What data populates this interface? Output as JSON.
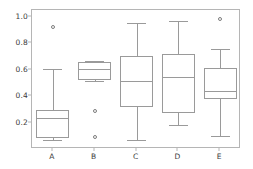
{
  "chart_data": {
    "type": "box",
    "title": "",
    "xlabel": "",
    "ylabel": "",
    "categories": [
      "A",
      "B",
      "C",
      "D",
      "E"
    ],
    "ylim": [
      0.0,
      1.05
    ],
    "yticks": [
      0.2,
      0.4,
      0.6,
      0.8,
      1.0
    ],
    "ytick_labels": [
      "0.2",
      "0.4",
      "0.6",
      "0.8",
      "1.0"
    ],
    "grid": false,
    "legend": null,
    "boxes": [
      {
        "label": "A",
        "whisker_low": 0.07,
        "q1": 0.08,
        "median": 0.235,
        "q3": 0.295,
        "whisker_high": 0.605,
        "outliers": [
          0.925
        ]
      },
      {
        "label": "B",
        "whisker_low": 0.515,
        "q1": 0.52,
        "median": 0.605,
        "q3": 0.655,
        "whisker_high": 0.665,
        "outliers": [
          0.285,
          0.09
        ]
      },
      {
        "label": "C",
        "whisker_low": 0.065,
        "q1": 0.315,
        "median": 0.51,
        "q3": 0.7,
        "whisker_high": 0.955,
        "outliers": []
      },
      {
        "label": "D",
        "whisker_low": 0.185,
        "q1": 0.275,
        "median": 0.545,
        "q3": 0.715,
        "whisker_high": 0.965,
        "outliers": []
      },
      {
        "label": "E",
        "whisker_low": 0.095,
        "q1": 0.38,
        "median": 0.435,
        "q3": 0.61,
        "whisker_high": 0.755,
        "outliers": [
          0.98
        ]
      }
    ]
  },
  "style": {
    "line_color": "#9a9a9a",
    "frame_color": "#b5b5b5",
    "text_color": "#3a3a3a",
    "background": "#ffffff"
  }
}
